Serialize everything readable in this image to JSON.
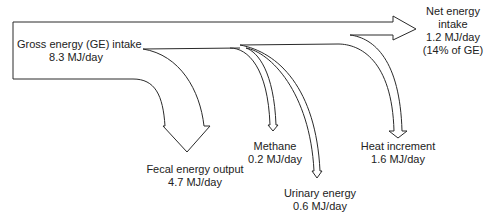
{
  "diagram": {
    "type": "energy-flow (Sankey-style)",
    "stroke_color": "#2a2a2a",
    "background": "#ffffff",
    "source": {
      "label": "Gross energy (GE) intake",
      "value": "8.3 MJ/day"
    },
    "outputs": [
      {
        "id": "fecal",
        "label": "Fecal energy output",
        "value": "4.7 MJ/day"
      },
      {
        "id": "methane",
        "label": "Methane",
        "value": "0.2 MJ/day"
      },
      {
        "id": "urinary",
        "label": "Urinary energy",
        "value": "0.6 MJ/day"
      },
      {
        "id": "heat",
        "label": "Heat increment",
        "value": "1.6 MJ/day"
      }
    ],
    "net": {
      "label_line1": "Net energy",
      "label_line2": "intake",
      "value": "1.2 MJ/day",
      "share": "(14% of GE)"
    }
  }
}
